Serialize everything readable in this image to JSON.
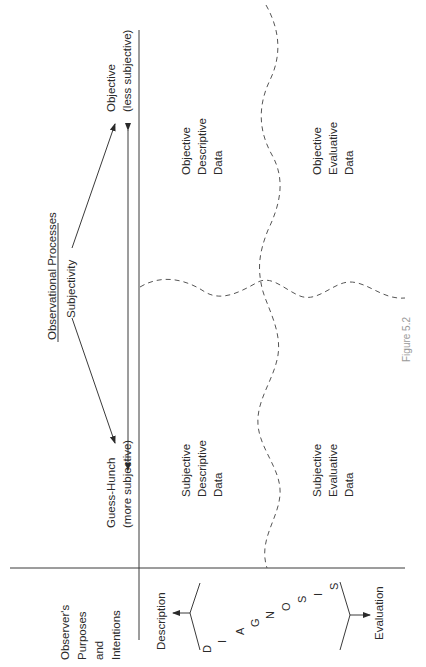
{
  "figure": {
    "caption": "Figure 5.2",
    "orientation": "rotated 90° counter-clockwise"
  },
  "header": {
    "title": "Observational Processes",
    "axis_label": "Subjectivity",
    "left_end": {
      "line1": "Guess-Hunch",
      "line2": "(more subjective)"
    },
    "right_end": {
      "line1": "Objective",
      "line2": "(less subjective)"
    }
  },
  "side": {
    "heading": {
      "line1": "Observer's",
      "line2": "Purposes",
      "line3": "and",
      "line4": "Intentions"
    },
    "top_branch": "Description",
    "bottom_branch": "Evaluation",
    "diagnosis_letters": [
      "D",
      "I",
      "A",
      "G",
      "N",
      "O",
      "S",
      "I",
      "S"
    ]
  },
  "quadrants": {
    "subjective_descriptive": {
      "line1": "Subjective",
      "line2": "Descriptive",
      "line3": "Data"
    },
    "objective_descriptive": {
      "line1": "Objective",
      "line2": "Descriptive",
      "line3": "Data"
    },
    "subjective_evaluative": {
      "line1": "Subjective",
      "line2": "Evaluative",
      "line3": "Data"
    },
    "objective_evaluative": {
      "line1": "Objective",
      "line2": "Evaluative",
      "line3": "Data"
    }
  }
}
